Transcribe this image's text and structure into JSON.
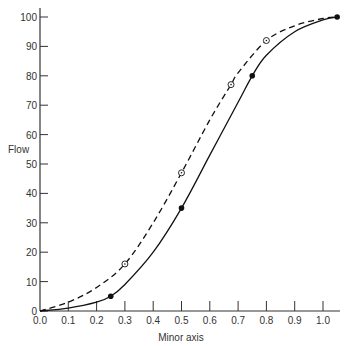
{
  "chart_data": {
    "type": "line",
    "title": "",
    "xlabel": "Minor axis",
    "ylabel": "Flow",
    "xlim": [
      0.0,
      1.05
    ],
    "ylim": [
      0,
      100
    ],
    "grid": false,
    "legend": null,
    "x_ticks": [
      "0.0",
      "0.1",
      "0.2",
      "0.3",
      "0.4",
      "0.5",
      "0.6",
      "0.7",
      "0.8",
      "0.9",
      "1.0"
    ],
    "y_ticks": [
      "0",
      "10",
      "20",
      "30",
      "40",
      "50",
      "60",
      "70",
      "80",
      "90",
      "100"
    ],
    "series": [
      {
        "name": "solid curve",
        "style": "solid",
        "marker": "filled-circle",
        "color": "#111111",
        "curve": [
          [
            0.0,
            0
          ],
          [
            0.1,
            1
          ],
          [
            0.2,
            3
          ],
          [
            0.25,
            5
          ],
          [
            0.3,
            9
          ],
          [
            0.4,
            20
          ],
          [
            0.5,
            35
          ],
          [
            0.6,
            53
          ],
          [
            0.7,
            71
          ],
          [
            0.75,
            80
          ],
          [
            0.8,
            87
          ],
          [
            0.9,
            95
          ],
          [
            1.0,
            99
          ],
          [
            1.05,
            100
          ]
        ],
        "points": [
          [
            0.25,
            5
          ],
          [
            0.5,
            35
          ],
          [
            0.75,
            80
          ],
          [
            1.05,
            100
          ]
        ]
      },
      {
        "name": "dashed curve",
        "style": "dashed",
        "marker": "open-circle-dot",
        "color": "#111111",
        "curve": [
          [
            0.0,
            0
          ],
          [
            0.1,
            3
          ],
          [
            0.2,
            8
          ],
          [
            0.3,
            16
          ],
          [
            0.4,
            30
          ],
          [
            0.5,
            47
          ],
          [
            0.6,
            65
          ],
          [
            0.675,
            77
          ],
          [
            0.7,
            81
          ],
          [
            0.8,
            92
          ],
          [
            0.9,
            97
          ],
          [
            1.0,
            99.5
          ],
          [
            1.05,
            100
          ]
        ],
        "points": [
          [
            0.3,
            16
          ],
          [
            0.5,
            47
          ],
          [
            0.675,
            77
          ],
          [
            0.8,
            92
          ]
        ]
      }
    ]
  }
}
